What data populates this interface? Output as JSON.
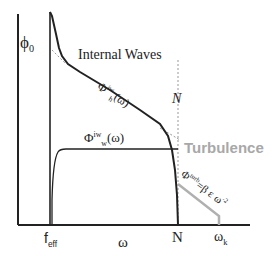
{
  "diagram": {
    "labels": {
      "phi0": "ϕ",
      "phi0_sub": "0",
      "internal_waves": "Internal Waves",
      "phi_h_main": "Φ",
      "phi_h_sup": "iw",
      "phi_h_sub": "h",
      "phi_h_arg": "(ω)",
      "phi_w_main": "Φ",
      "phi_w_sup": "iw",
      "phi_w_sub": "w",
      "phi_w_arg": "(ω)",
      "N_italic": "N",
      "turbulence": "Turbulence",
      "turb_main": "Φ",
      "turb_sup": "turb",
      "turb_formula": "=β ε ω",
      "turb_exp": "-2",
      "x_feff": "f",
      "x_feff_sub": "eff",
      "x_omega": "ω",
      "x_N": "N",
      "x_omegak": "ω",
      "x_omegak_sub": "k"
    },
    "colors": {
      "line": "#222222",
      "turbulence": "#b0b0b0",
      "dashed": "#999999"
    }
  }
}
